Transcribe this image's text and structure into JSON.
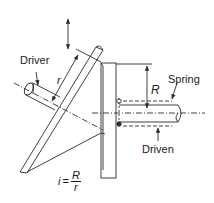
{
  "diagram": {
    "type": "friction-disc-drive",
    "labels": {
      "driver": "Driver",
      "spring": "Spring",
      "driven": "Driven",
      "radius_small": "r",
      "radius_large": "R"
    },
    "formula": {
      "lhs": "i",
      "equals": "=",
      "numerator": "R",
      "denominator": "r"
    },
    "colors": {
      "line": "#2a2a2a",
      "background": "#ffffff"
    }
  }
}
